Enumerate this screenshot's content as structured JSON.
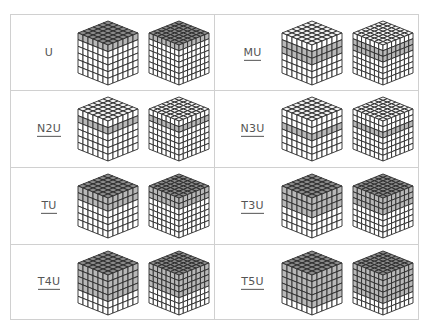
{
  "colors": {
    "border": "#d0d0d0",
    "label": "#555555",
    "face_white": "#ffffff",
    "face_shaded": "#b8b8b8",
    "top_shaded": "#8a8a8a",
    "top_white": "#f4f4f4",
    "edge": "#2a2a2a"
  },
  "cells": [
    {
      "label": "U",
      "underlined": false,
      "shaded_layers": [
        1
      ]
    },
    {
      "label": "MU",
      "underlined": true,
      "shaded_layers": [
        2,
        3
      ]
    },
    {
      "label": "N2U",
      "underlined": true,
      "shaded_layers": [
        2
      ]
    },
    {
      "label": "N3U",
      "underlined": true,
      "shaded_layers": [
        3
      ]
    },
    {
      "label": "TU",
      "underlined": true,
      "shaded_layers": [
        1,
        2
      ]
    },
    {
      "label": "T3U",
      "underlined": true,
      "shaded_layers": [
        1,
        2,
        3
      ]
    },
    {
      "label": "T4U",
      "underlined": true,
      "shaded_layers": [
        1,
        2,
        3,
        4
      ]
    },
    {
      "label": "T5U",
      "underlined": true,
      "shaded_layers": [
        1,
        2,
        3,
        4,
        5
      ]
    }
  ],
  "cube_sizes": [
    6,
    7
  ]
}
